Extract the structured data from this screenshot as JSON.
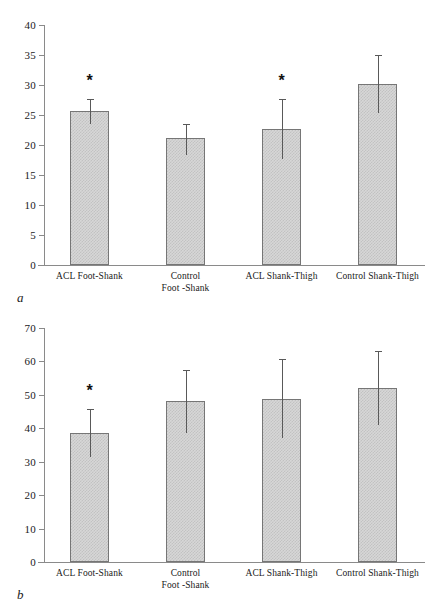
{
  "figure": {
    "panel_a_letter": "a",
    "panel_b_letter": "b"
  },
  "chart_data": [
    {
      "type": "bar",
      "panel": "a",
      "title": "",
      "xlabel": "",
      "ylabel": "",
      "ylim": [
        0,
        40
      ],
      "yticks": [
        0,
        5,
        10,
        15,
        20,
        25,
        30,
        35,
        40
      ],
      "ytick_labels": [
        "0",
        "5",
        "10",
        "15",
        "20",
        "25",
        "30",
        "35",
        "40"
      ],
      "grid": false,
      "legend": "none",
      "categories": [
        "ACL Foot-Shank",
        "Control\nFoot -Shank",
        "ACL Shank-Thigh",
        "Control Shank-Thigh"
      ],
      "values": [
        25.6,
        21.1,
        22.6,
        30.1
      ],
      "err_low": [
        23.4,
        18.3,
        17.6,
        25.3
      ],
      "err_high": [
        27.6,
        23.5,
        27.6,
        35.0
      ],
      "annotations": [
        {
          "category": "ACL Foot-Shank",
          "text": "*"
        },
        {
          "category": "ACL Shank-Thigh",
          "text": "*"
        }
      ]
    },
    {
      "type": "bar",
      "panel": "b",
      "title": "",
      "xlabel": "",
      "ylabel": "",
      "ylim": [
        0,
        70
      ],
      "yticks": [
        0,
        10,
        20,
        30,
        40,
        50,
        60,
        70
      ],
      "ytick_labels": [
        "0",
        "10",
        "20",
        "30",
        "40",
        "50",
        "60",
        "70"
      ],
      "grid": false,
      "legend": "none",
      "categories": [
        "ACL Foot-Shank",
        "Control\nFoot -Shank",
        "ACL Shank-Thigh",
        "Control Shank-Thigh"
      ],
      "values": [
        38.7,
        48.3,
        48.9,
        52.0
      ],
      "err_low": [
        31.4,
        38.8,
        37.2,
        41.2
      ],
      "err_high": [
        45.8,
        57.5,
        60.8,
        63.2
      ],
      "annotations": [
        {
          "category": "ACL Foot-Shank",
          "text": "*"
        }
      ]
    }
  ]
}
